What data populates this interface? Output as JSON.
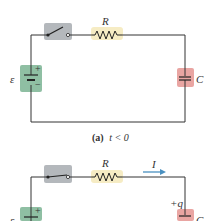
{
  "diagram_a": {
    "resistor_label": "R",
    "emf_label": "ε",
    "capacitor_label": "C",
    "battery_plus": "+",
    "battery_minus": "−",
    "caption_part": "(a)",
    "caption_condition": "t < 0"
  },
  "diagram_b": {
    "resistor_label": "R",
    "current_label": "I",
    "emf_label": "ε",
    "capacitor_label": "C",
    "charge_label": "+q",
    "battery_plus": "+"
  },
  "colors": {
    "switch_bg": "#b4b8bc",
    "resistor_bg": "#f6ecc4",
    "battery_bg": "#8fbfa3",
    "capacitor_bg": "#e9a5a2",
    "arrow": "#4a90c0",
    "wire": "#333333"
  }
}
